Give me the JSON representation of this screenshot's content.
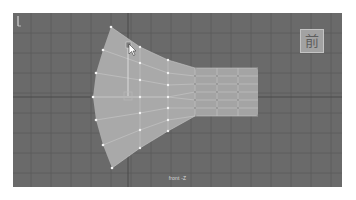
{
  "viewport": {
    "camera_label": "front -Z",
    "view_cube_label": "前",
    "background_color": "#6a6a6a",
    "mesh_color": "#a8a8a8",
    "vertex_color": "#f2f2f2",
    "grid_color": "#595959"
  },
  "mesh": {
    "fan_columns": [
      {
        "x_left": [
          111,
          103,
          96,
          93,
          96,
          103,
          112
        ],
        "y": [
          27,
          50,
          73,
          97,
          120,
          145,
          168
        ]
      },
      {
        "x": 140,
        "y": [
          47,
          63,
          80,
          97,
          113,
          130,
          148
        ]
      },
      {
        "x": 168,
        "y": [
          60,
          73,
          85,
          97,
          108,
          120,
          131
        ]
      }
    ],
    "strip": {
      "x": [
        195,
        217,
        238,
        258
      ],
      "y": [
        68,
        76,
        84,
        92,
        100,
        108,
        116
      ]
    }
  },
  "icons": {
    "cursor": "mouse-pointer-icon",
    "manipulator": "move-manipulator-icon",
    "axis": "axis-indicator-icon"
  }
}
